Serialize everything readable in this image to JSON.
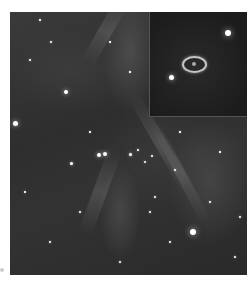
{
  "image": {
    "subject": "Star field with nebular filaments and an inset of a ring-shaped object",
    "colors": {
      "background": "#ffffff",
      "sky": "#2e2e2e",
      "inset_sky": "#1c1c1c",
      "ring": "#e1e1e1"
    },
    "frame": {
      "x": 10,
      "y": 12,
      "width": 237,
      "height": 263
    },
    "inset": {
      "x": 139,
      "y": 0,
      "width": 98,
      "height": 104,
      "ring": {
        "cx": 45,
        "cy": 53,
        "rx": 13,
        "ry": 9
      },
      "stars": [
        {
          "x": 78,
          "y": 21,
          "r": 3
        },
        {
          "x": 21,
          "y": 65,
          "r": 2.5
        }
      ]
    },
    "streaks": [
      {
        "x": 95,
        "y": 20,
        "w": 70,
        "h": 14,
        "angle": -60
      },
      {
        "x": 90,
        "y": 180,
        "w": 90,
        "h": 14,
        "angle": -70
      },
      {
        "x": 150,
        "y": 130,
        "w": 110,
        "h": 12,
        "angle": 60
      },
      {
        "x": 170,
        "y": 160,
        "w": 110,
        "h": 10,
        "angle": 62
      }
    ],
    "stars": [
      {
        "x": 5,
        "y": 111,
        "r": 2.5
      },
      {
        "x": 56,
        "y": 80,
        "r": 2
      },
      {
        "x": 183,
        "y": 220,
        "r": 3
      },
      {
        "x": 89,
        "y": 143,
        "r": 2
      },
      {
        "x": 95,
        "y": 142,
        "r": 2
      },
      {
        "x": 61,
        "y": 151,
        "r": 1.5
      },
      {
        "x": 120,
        "y": 142,
        "r": 1.5
      },
      {
        "x": 128,
        "y": 138,
        "r": 1.2
      },
      {
        "x": 135,
        "y": 150,
        "r": 1.2
      },
      {
        "x": 142,
        "y": 144,
        "r": 1
      },
      {
        "x": 20,
        "y": 48,
        "r": 1
      },
      {
        "x": 41,
        "y": 30,
        "r": 1
      },
      {
        "x": 30,
        "y": 8,
        "r": 0.8
      },
      {
        "x": 80,
        "y": 120,
        "r": 0.8
      },
      {
        "x": 70,
        "y": 200,
        "r": 1
      },
      {
        "x": 110,
        "y": 250,
        "r": 1
      },
      {
        "x": 160,
        "y": 230,
        "r": 1
      },
      {
        "x": 200,
        "y": 190,
        "r": 1
      },
      {
        "x": 225,
        "y": 245,
        "r": 1
      },
      {
        "x": 40,
        "y": 230,
        "r": 1
      },
      {
        "x": 15,
        "y": 180,
        "r": 0.8
      },
      {
        "x": 145,
        "y": 185,
        "r": 1
      },
      {
        "x": 120,
        "y": 60,
        "r": 0.8
      },
      {
        "x": 100,
        "y": 30,
        "r": 0.8
      },
      {
        "x": 170,
        "y": 120,
        "r": 0.8
      },
      {
        "x": 210,
        "y": 140,
        "r": 0.8
      },
      {
        "x": 230,
        "y": 205,
        "r": 1
      },
      {
        "x": 55,
        "y": 265,
        "r": 0.8
      },
      {
        "x": 140,
        "y": 200,
        "r": 1
      },
      {
        "x": 165,
        "y": 158,
        "r": 1
      }
    ]
  }
}
